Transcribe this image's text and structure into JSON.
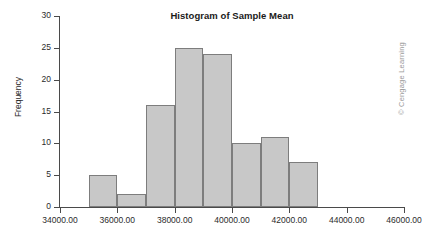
{
  "watermark": {
    "text": "© Cengage Learning"
  },
  "colors": {
    "bar_fill": "#c8c8c8",
    "bar_border": "#7d7d7d",
    "axis": "#4a4a4a",
    "text": "#2b2b2b",
    "background": "#ffffff",
    "watermark": "#9a9a9a"
  },
  "chart_data": {
    "type": "bar",
    "title": "Histogram of Sample Mean",
    "xlabel": "",
    "ylabel": "Frequency",
    "grid": false,
    "legend": null,
    "xlim": [
      34000,
      46000
    ],
    "ylim": [
      0,
      30
    ],
    "xticks": [
      34000,
      36000,
      38000,
      40000,
      42000,
      44000,
      46000
    ],
    "xtick_labels": [
      "34000.00",
      "36000.00",
      "38000.00",
      "40000.00",
      "42000.00",
      "44000.00",
      "46000.00"
    ],
    "yticks": [
      0,
      5,
      10,
      15,
      20,
      25,
      30
    ],
    "ytick_labels": [
      "0",
      "5",
      "10",
      "15",
      "20",
      "25",
      "30"
    ],
    "bin_width": 1000,
    "bin_edges": [
      35000,
      36000,
      37000,
      38000,
      39000,
      40000,
      41000,
      42000,
      43000
    ],
    "categories": [
      "35000-36000",
      "36000-37000",
      "37000-38000",
      "38000-39000",
      "39000-40000",
      "40000-41000",
      "41000-42000",
      "42000-43000"
    ],
    "bins": [
      {
        "start": 35000,
        "end": 36000,
        "value": 5
      },
      {
        "start": 36000,
        "end": 37000,
        "value": 2
      },
      {
        "start": 37000,
        "end": 38000,
        "value": 16
      },
      {
        "start": 38000,
        "end": 39000,
        "value": 25
      },
      {
        "start": 39000,
        "end": 40000,
        "value": 24
      },
      {
        "start": 40000,
        "end": 41000,
        "value": 10
      },
      {
        "start": 41000,
        "end": 42000,
        "value": 11
      },
      {
        "start": 42000,
        "end": 43000,
        "value": 7
      }
    ],
    "values": [
      5,
      2,
      16,
      25,
      24,
      10,
      11,
      7
    ]
  }
}
